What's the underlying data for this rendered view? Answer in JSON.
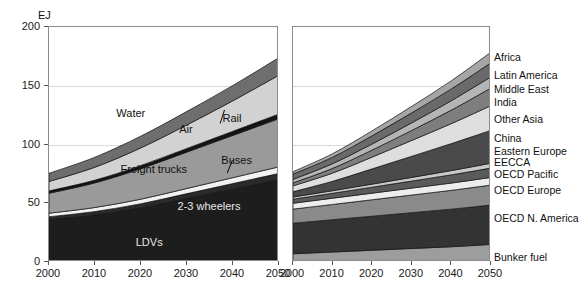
{
  "figure": {
    "unit_label": "EJ",
    "y_ticks": [
      0,
      50,
      100,
      150,
      200
    ],
    "x_ticks": [
      2000,
      2010,
      2020,
      2030,
      2040,
      2050
    ]
  },
  "chart_data": [
    {
      "type": "area",
      "title": "",
      "subtitle": "Global transport final energy demand by mode",
      "xlabel": "",
      "ylabel": "EJ",
      "ylim": [
        0,
        200
      ],
      "xlim": [
        2000,
        2050
      ],
      "grid": true,
      "stacked": true,
      "legend_position": "in-plot-annotations",
      "x": [
        2000,
        2010,
        2020,
        2030,
        2040,
        2050
      ],
      "series": [
        {
          "name": "LDVs",
          "values": [
            36.0,
            40.0,
            46.0,
            54.0,
            62.0,
            70.0
          ],
          "color": "#1d1d1d"
        },
        {
          "name": "2-3 wheelers",
          "values": [
            2.5,
            3.0,
            3.6,
            4.2,
            4.8,
            5.4
          ],
          "color": "#2a2a2a"
        },
        {
          "name": "Buses",
          "values": [
            3.0,
            3.4,
            3.9,
            4.4,
            5.0,
            5.6
          ],
          "color": "#f2f2f2"
        },
        {
          "name": "Freight trucks",
          "values": [
            17.0,
            21.0,
            26.0,
            31.0,
            36.0,
            41.0
          ],
          "color": "#9a9a9a"
        },
        {
          "name": "Rail",
          "values": [
            2.0,
            2.3,
            2.7,
            3.1,
            3.5,
            4.0
          ],
          "color": "#141414"
        },
        {
          "name": "Air",
          "values": [
            8.0,
            11.0,
            15.0,
            20.0,
            26.0,
            33.0
          ],
          "color": "#d2d2d2"
        },
        {
          "name": "Water",
          "values": [
            7.0,
            8.5,
            10.0,
            11.5,
            13.0,
            15.0
          ],
          "color": "#6e6e6e"
        }
      ],
      "annotations": [
        {
          "text": "Water",
          "x": 2018,
          "y": 126
        },
        {
          "text": "Air",
          "x": 2030,
          "y": 112
        },
        {
          "text": "Rail",
          "x": 2040,
          "y": 122
        },
        {
          "text": "Freight trucks",
          "x": 2023,
          "y": 78
        },
        {
          "text": "Buses",
          "x": 2041,
          "y": 86
        },
        {
          "text": "2-3 wheelers",
          "x": 2035,
          "y": 47
        },
        {
          "text": "LDVs",
          "x": 2022,
          "y": 16
        }
      ]
    },
    {
      "type": "area",
      "title": "",
      "subtitle": "Global transport final energy demand by region",
      "xlabel": "",
      "ylabel": "EJ",
      "ylim": [
        0,
        200
      ],
      "xlim": [
        2000,
        2050
      ],
      "grid": true,
      "stacked": true,
      "legend_position": "right",
      "x": [
        2000,
        2010,
        2020,
        2030,
        2040,
        2050
      ],
      "series": [
        {
          "name": "Bunker fuel",
          "values": [
            7.0,
            8.5,
            10.0,
            11.5,
            13.0,
            15.0
          ],
          "color": "#9d9d9d"
        },
        {
          "name": "OECD N. America",
          "values": [
            26.0,
            27.5,
            29.0,
            30.5,
            32.0,
            33.5
          ],
          "color": "#333333"
        },
        {
          "name": "OECD Europe",
          "values": [
            12.0,
            13.0,
            14.0,
            15.0,
            16.0,
            17.0
          ],
          "color": "#8a8a8a"
        },
        {
          "name": "OECD Pacific",
          "values": [
            5.0,
            5.3,
            5.6,
            5.9,
            6.2,
            6.5
          ],
          "color": "#ededed"
        },
        {
          "name": "EECCA",
          "values": [
            3.5,
            4.2,
            5.1,
            6.0,
            7.0,
            8.0
          ],
          "color": "#5a5a5a"
        },
        {
          "name": "Eastern Europe",
          "values": [
            1.8,
            2.2,
            2.6,
            3.1,
            3.6,
            4.1
          ],
          "color": "#c9c9c9"
        },
        {
          "name": "China",
          "values": [
            4.5,
            8.0,
            13.0,
            18.0,
            23.0,
            28.0
          ],
          "color": "#4a4a4a"
        },
        {
          "name": "Other Asia",
          "values": [
            5.0,
            7.0,
            10.0,
            13.5,
            17.0,
            21.0
          ],
          "color": "#dedede"
        },
        {
          "name": "India",
          "values": [
            2.5,
            4.0,
            6.0,
            8.5,
            11.5,
            15.0
          ],
          "color": "#7e7e7e"
        },
        {
          "name": "Middle East",
          "values": [
            3.0,
            4.0,
            5.2,
            6.5,
            8.0,
            9.5
          ],
          "color": "#b5b5b5"
        },
        {
          "name": "Latin America",
          "values": [
            4.5,
            5.5,
            7.0,
            8.5,
            10.0,
            12.0
          ],
          "color": "#6a6a6a"
        },
        {
          "name": "Africa",
          "values": [
            2.0,
            3.0,
            4.2,
            5.5,
            7.0,
            9.0
          ],
          "color": "#a6a6a6"
        }
      ],
      "legend_entries": [
        {
          "label": "Africa"
        },
        {
          "label": "Latin America"
        },
        {
          "label": "Middle East"
        },
        {
          "label": "India"
        },
        {
          "label": "Other Asia"
        },
        {
          "label": "China"
        },
        {
          "label": "Eastern Europe"
        },
        {
          "label": "EECCA"
        },
        {
          "label": "OECD Pacific"
        },
        {
          "label": "OECD Europe"
        },
        {
          "label": "OECD N. America"
        },
        {
          "label": "Bunker fuel"
        }
      ]
    }
  ]
}
